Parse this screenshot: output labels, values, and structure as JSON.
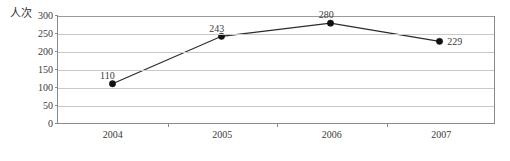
{
  "chart_data": {
    "type": "line",
    "title": "",
    "xlabel": "",
    "ylabel": "人次",
    "categories": [
      "2004",
      "2005",
      "2006",
      "2007"
    ],
    "values": [
      110,
      243,
      280,
      229
    ],
    "point_labels": [
      "110",
      "243",
      "280",
      "229"
    ],
    "ylim": [
      0,
      300
    ],
    "y_ticks": [
      0,
      50,
      100,
      150,
      200,
      250,
      300
    ],
    "y_tick_labels": [
      "0",
      "50",
      "100",
      "150",
      "200",
      "250",
      "300"
    ],
    "grid": true,
    "legend": "none",
    "series": [
      {
        "name": "人次",
        "values": [
          110,
          243,
          280,
          229
        ]
      }
    ]
  },
  "axis": {
    "y_title": "人次"
  },
  "colors": {
    "line": "#2b2b2b",
    "marker": "#111111",
    "gridline": "#c9c9c9",
    "axis": "#8a8a8a",
    "text": "#3a3a3a",
    "background": "#ffffff"
  }
}
